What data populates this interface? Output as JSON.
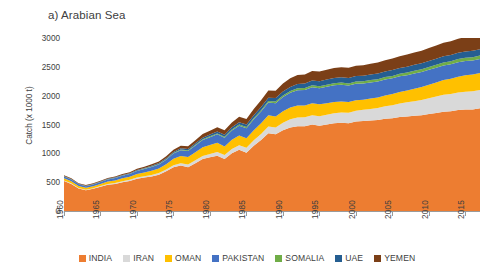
{
  "chart_data": {
    "type": "area",
    "stacked": true,
    "title": "a) Arabian Sea",
    "xlabel": "",
    "ylabel": "Catch (x 1000 t)",
    "ylim": [
      0,
      3000
    ],
    "ytick_values": [
      0,
      500,
      1000,
      1500,
      2000,
      2500,
      3000
    ],
    "ytick_labels": [
      "0",
      "500",
      "1000",
      "1500",
      "2000",
      "2500",
      "3000"
    ],
    "xlim": [
      1960,
      2017
    ],
    "xtick_values": [
      1960,
      1965,
      1970,
      1975,
      1980,
      1985,
      1990,
      1995,
      2000,
      2005,
      2010,
      2015
    ],
    "xtick_labels": [
      "1960",
      "1965",
      "1970",
      "1975",
      "1980",
      "1985",
      "1990",
      "1995",
      "2000",
      "2005",
      "2010",
      "2015"
    ],
    "grid": false,
    "legend_position": "bottom",
    "x": [
      1960,
      1961,
      1962,
      1963,
      1964,
      1965,
      1966,
      1967,
      1968,
      1969,
      1970,
      1971,
      1972,
      1973,
      1974,
      1975,
      1976,
      1977,
      1978,
      1979,
      1980,
      1981,
      1982,
      1983,
      1984,
      1985,
      1986,
      1987,
      1988,
      1989,
      1990,
      1991,
      1992,
      1993,
      1994,
      1995,
      1996,
      1997,
      1998,
      1999,
      2000,
      2001,
      2002,
      2003,
      2004,
      2005,
      2006,
      2007,
      2008,
      2009,
      2010,
      2011,
      2012,
      2013,
      2014,
      2015,
      2016,
      2017
    ],
    "series": [
      {
        "name": "INDIA",
        "color": "#ED7D31",
        "values": [
          520,
          470,
          390,
          360,
          385,
          420,
          455,
          470,
          500,
          520,
          560,
          580,
          600,
          630,
          690,
          760,
          790,
          760,
          830,
          900,
          930,
          960,
          900,
          1000,
          1060,
          1010,
          1130,
          1230,
          1350,
          1330,
          1400,
          1450,
          1470,
          1470,
          1500,
          1480,
          1500,
          1520,
          1530,
          1520,
          1550,
          1560,
          1570,
          1580,
          1600,
          1610,
          1630,
          1640,
          1650,
          1660,
          1680,
          1700,
          1720,
          1730,
          1750,
          1760,
          1760,
          1780
        ]
      },
      {
        "name": "IRAN",
        "color": "#D9D9D9",
        "values": [
          10,
          10,
          10,
          10,
          10,
          12,
          14,
          16,
          18,
          20,
          22,
          24,
          26,
          28,
          30,
          35,
          40,
          45,
          50,
          55,
          60,
          65,
          70,
          75,
          80,
          85,
          95,
          105,
          115,
          120,
          130,
          140,
          150,
          155,
          160,
          165,
          170,
          175,
          180,
          185,
          190,
          195,
          200,
          205,
          215,
          225,
          235,
          245,
          255,
          265,
          275,
          285,
          295,
          300,
          305,
          310,
          315,
          320
        ]
      },
      {
        "name": "OMAN",
        "color": "#FFC000",
        "values": [
          40,
          38,
          35,
          33,
          35,
          38,
          42,
          45,
          48,
          52,
          58,
          64,
          70,
          78,
          90,
          110,
          125,
          130,
          140,
          150,
          155,
          160,
          150,
          160,
          170,
          165,
          175,
          185,
          195,
          190,
          200,
          205,
          210,
          205,
          210,
          205,
          200,
          195,
          190,
          185,
          180,
          175,
          180,
          185,
          190,
          195,
          200,
          205,
          215,
          225,
          235,
          245,
          255,
          265,
          275,
          285,
          290,
          295
        ]
      },
      {
        "name": "PAKISTAN",
        "color": "#4472C4",
        "values": [
          30,
          30,
          28,
          28,
          30,
          33,
          36,
          40,
          44,
          48,
          54,
          60,
          66,
          72,
          80,
          90,
          100,
          105,
          115,
          125,
          135,
          145,
          150,
          160,
          170,
          175,
          190,
          205,
          220,
          230,
          245,
          255,
          265,
          270,
          275,
          280,
          285,
          290,
          290,
          285,
          285,
          280,
          280,
          275,
          275,
          270,
          270,
          265,
          265,
          260,
          260,
          255,
          255,
          250,
          250,
          245,
          245,
          240
        ]
      },
      {
        "name": "SOMALIA",
        "color": "#70AD47",
        "values": [
          3,
          3,
          3,
          3,
          3,
          4,
          4,
          5,
          5,
          6,
          6,
          7,
          8,
          8,
          9,
          10,
          11,
          12,
          13,
          14,
          15,
          16,
          17,
          18,
          19,
          20,
          22,
          24,
          26,
          27,
          29,
          30,
          32,
          33,
          34,
          35,
          36,
          37,
          38,
          38,
          39,
          40,
          40,
          41,
          42,
          43,
          44,
          45,
          46,
          47,
          48,
          49,
          50,
          52,
          54,
          56,
          58,
          60
        ]
      },
      {
        "name": "UAE",
        "color": "#255E91</tmp>",
        "values": [
          5,
          5,
          5,
          5,
          6,
          6,
          7,
          8,
          9,
          10,
          11,
          12,
          14,
          15,
          17,
          19,
          21,
          23,
          25,
          28,
          30,
          33,
          36,
          38,
          42,
          45,
          50,
          55,
          60,
          62,
          68,
          72,
          76,
          78,
          82,
          85,
          88,
          90,
          92,
          94,
          95,
          96,
          97,
          98,
          99,
          100,
          101,
          102,
          103,
          104,
          105,
          106,
          107,
          108,
          109,
          110,
          110,
          111
        ]
      },
      {
        "name": "YEMEN",
        "color": "#7B3F17",
        "values": [
          12,
          12,
          11,
          11,
          12,
          13,
          14,
          15,
          17,
          18,
          20,
          22,
          25,
          28,
          32,
          38,
          44,
          48,
          55,
          62,
          68,
          75,
          78,
          85,
          92,
          95,
          105,
          115,
          125,
          128,
          140,
          148,
          155,
          158,
          165,
          168,
          170,
          172,
          174,
          176,
          178,
          180,
          185,
          190,
          195,
          200,
          205,
          210,
          215,
          220,
          225,
          230,
          235,
          240,
          245,
          250,
          255,
          260
        ]
      }
    ]
  },
  "legend": {
    "items": [
      {
        "label": "INDIA",
        "color": "#ED7D31"
      },
      {
        "label": "IRAN",
        "color": "#D9D9D9"
      },
      {
        "label": "OMAN",
        "color": "#FFC000"
      },
      {
        "label": "PAKISTAN",
        "color": "#4472C4"
      },
      {
        "label": "SOMALIA",
        "color": "#70AD47"
      },
      {
        "label": "UAE",
        "color": "#255E91"
      },
      {
        "label": "YEMEN",
        "color": "#7B3F17"
      }
    ]
  }
}
